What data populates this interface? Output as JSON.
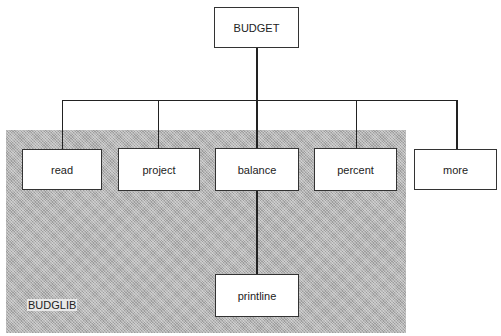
{
  "diagram": {
    "root": {
      "label": "BUDGET"
    },
    "children": [
      {
        "label": "read",
        "in_library": true
      },
      {
        "label": "project",
        "in_library": true
      },
      {
        "label": "balance",
        "in_library": true
      },
      {
        "label": "percent",
        "in_library": true
      },
      {
        "label": "more",
        "in_library": false
      }
    ],
    "grandchild": {
      "label": "printline",
      "parent": "balance"
    },
    "library": {
      "label": "BUDGLIB",
      "fill": "#b4b4b4"
    }
  }
}
